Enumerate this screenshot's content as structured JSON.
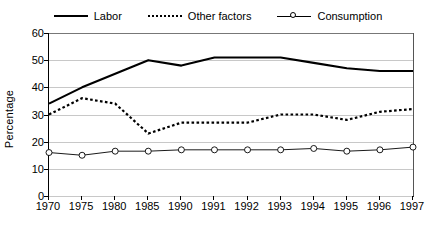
{
  "chart_data": {
    "type": "line",
    "title": "",
    "xlabel": "",
    "ylabel": "Percentage",
    "ylim": [
      0,
      60
    ],
    "ytick_step": 10,
    "yticks": [
      60,
      50,
      40,
      30,
      20,
      10,
      0
    ],
    "grid": true,
    "legend_position": "top",
    "categories": [
      "1970",
      "1975",
      "1980",
      "1985",
      "1990",
      "1991",
      "1992",
      "1993",
      "1994",
      "1995",
      "1996",
      "1997"
    ],
    "series": [
      {
        "name": "Labor",
        "style": "solid",
        "marker": "none",
        "color": "#000000",
        "values": [
          34,
          40,
          45,
          50,
          48,
          51,
          51,
          51,
          49,
          47,
          46,
          46
        ]
      },
      {
        "name": "Other factors",
        "style": "dotted",
        "marker": "none",
        "color": "#000000",
        "values": [
          30,
          36,
          34,
          23,
          27,
          27,
          27,
          30,
          30,
          28,
          31,
          32
        ]
      },
      {
        "name": "Consumption",
        "style": "solid-thin",
        "marker": "circle",
        "color": "#000000",
        "values": [
          16,
          15,
          16.5,
          16.5,
          17,
          17,
          17,
          17,
          17.5,
          16.5,
          17,
          18
        ]
      }
    ]
  },
  "legend": {
    "entries": [
      {
        "label": "Labor",
        "swatch": "solid-line-swatch"
      },
      {
        "label": "Other factors",
        "swatch": "dotted-line-swatch"
      },
      {
        "label": "Consumption",
        "swatch": "circle-marker-line-swatch"
      }
    ]
  }
}
